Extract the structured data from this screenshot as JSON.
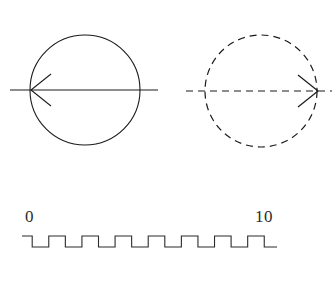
{
  "figure": {
    "background_color": "#ffffff",
    "line_color": "#1a1a1a",
    "panels": [
      {
        "name": "left-circle-panel",
        "style": "solid",
        "circle": {
          "cx": 85,
          "cy": 90,
          "r": 55
        },
        "axis": {
          "x1": 10,
          "x2": 158,
          "y": 90
        },
        "arrow": {
          "direction": "left",
          "tip_x": 31,
          "tip_y": 90
        }
      },
      {
        "name": "right-circle-panel",
        "style": "dashed",
        "dash_pattern": "7,5",
        "circle": {
          "cx": 261,
          "cy": 91,
          "r": 56
        },
        "axis": {
          "x1": 186,
          "x2": 332,
          "y": 91
        },
        "arrow": {
          "direction": "right",
          "tip_x": 318,
          "tip_y": 91
        }
      }
    ],
    "waveform": {
      "name": "square-wave",
      "type": "square",
      "start_label": "0",
      "end_label": "10",
      "start_x": 22,
      "end_x": 277,
      "high_y": 236,
      "low_y": 247,
      "cycles": 6,
      "period_px": 42,
      "label_y": 222,
      "start_label_x": 25,
      "end_label_x": 255
    }
  },
  "chart_data": {
    "type": "line",
    "title": "",
    "xlabel": "",
    "ylabel": "",
    "xlim": [
      0,
      10
    ],
    "ylim": [
      0,
      1
    ],
    "grid": false,
    "legend": null,
    "tick_labels": [
      "0",
      "10"
    ],
    "series": [
      {
        "name": "square-wave",
        "waveform": "square",
        "duty_cycle": 0.5,
        "periods": 6,
        "x": [
          0,
          0.4,
          0.4,
          1.05,
          1.05,
          1.7,
          1.7,
          2.35,
          2.35,
          3.0,
          3.0,
          3.65,
          3.65,
          4.3,
          4.3,
          4.95,
          4.95,
          5.6,
          5.6,
          6.25,
          6.25,
          6.9,
          6.9,
          7.55,
          7.55,
          8.2,
          8.2,
          8.85,
          8.85,
          9.5,
          9.5,
          10
        ],
        "values": [
          1,
          1,
          0,
          0,
          1,
          1,
          0,
          0,
          1,
          1,
          0,
          0,
          1,
          1,
          0,
          0,
          1,
          1,
          0,
          0,
          1,
          1,
          0,
          0,
          1,
          1,
          0,
          0,
          1,
          1,
          0,
          0
        ]
      }
    ]
  }
}
